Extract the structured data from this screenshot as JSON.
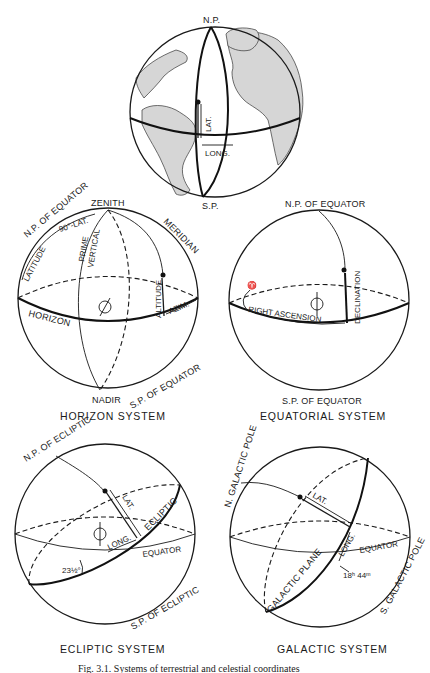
{
  "figure": {
    "caption": "Fig. 3.1. Systems of terrestrial and celestial coordinates",
    "panels": [
      {
        "id": "terrestrial",
        "title": "",
        "labels": {
          "north_pole": "N.P.",
          "south_pole": "S.P.",
          "latitude": "LAT.",
          "longitude": "LONG."
        }
      },
      {
        "id": "horizon",
        "title": "HORIZON SYSTEM",
        "labels": {
          "zenith": "ZENITH",
          "nadir": "NADIR",
          "np_equator": "N.P. OF EQUATOR",
          "sp_equator": "S.P. OF EQUATOR",
          "colatitude": "90°-LAT.",
          "latitude": "LATITUDE",
          "prime": "PRIME",
          "vertical": "VERTICAL",
          "meridian": "MERIDIAN",
          "horizon": "HORIZON",
          "altitude": "ALTITUDE",
          "azimuth": "AZIM."
        }
      },
      {
        "id": "equatorial",
        "title": "EQUATORIAL SYSTEM",
        "labels": {
          "np_equator": "N.P. OF EQUATOR",
          "sp_equator": "S.P. OF EQUATOR",
          "right_ascension": "RIGHT ASCENSION",
          "declination": "DECLINATION",
          "vernal_mark": "♈"
        }
      },
      {
        "id": "ecliptic",
        "title": "ECLIPTIC SYSTEM",
        "labels": {
          "np_ecliptic": "N.P. OF ECLIPTIC",
          "sp_ecliptic": "S.P. OF ECLIPTIC",
          "ecliptic": "ECLIPTIC",
          "equator": "EQUATOR",
          "latitude": "LAT.",
          "longitude": "LONG.",
          "obliquity": "23½°"
        }
      },
      {
        "id": "galactic",
        "title": "GALACTIC SYSTEM",
        "labels": {
          "n_galactic_pole": "N. GALACTIC POLE",
          "s_galactic_pole": "S. GALACTIC POLE",
          "galactic_plane": "GALACTIC PLANE",
          "equator": "EQUATOR",
          "latitude": "LAT.",
          "longitude": "LONG.",
          "node_ra": "18ʰ 44ᵐ"
        }
      }
    ],
    "symbols": {
      "sun_observer": "earth-symbol"
    }
  }
}
